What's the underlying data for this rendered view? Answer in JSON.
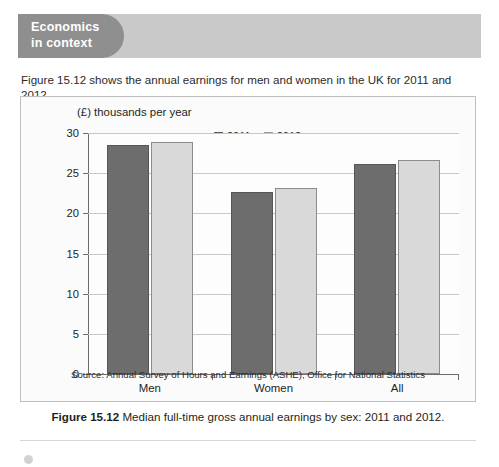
{
  "banner": {
    "title_line1": "Economics",
    "title_line2": "in context",
    "pill_color": "#8f8f8f",
    "bar_color": "#c9c9c9"
  },
  "intro": {
    "text": "Figure 15.12 shows the annual earnings for men and women in the UK for 2011 and 2012."
  },
  "chart_panel": {
    "source": "Source: Annual Survey of Hours and Earnings (ASHE), Office for National Statistics"
  },
  "caption": {
    "figure_number": "Figure 15.12",
    "text": "Median full-time gross annual earnings by sex: 2011 and 2012."
  },
  "chart_data": {
    "type": "bar",
    "title": "",
    "ylabel": "(£) thousands per year",
    "xlabel": "",
    "categories": [
      "Men",
      "Women",
      "All"
    ],
    "series": [
      {
        "name": "2011",
        "color": "#6d6d6d",
        "values": [
          28.5,
          22.7,
          26.2
        ]
      },
      {
        "name": "2012",
        "color": "#d9d9d9",
        "values": [
          28.9,
          23.2,
          26.6
        ]
      }
    ],
    "ylim": [
      0,
      30
    ],
    "yticks": [
      0,
      5,
      10,
      15,
      20,
      25,
      30
    ],
    "grid": true,
    "legend_position": "top-center"
  }
}
